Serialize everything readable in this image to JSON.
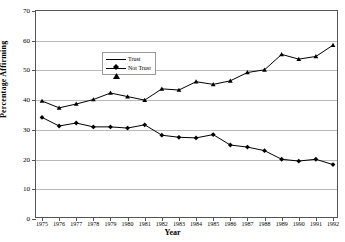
{
  "chart_data": {
    "type": "line",
    "title": "",
    "xlabel": "Year",
    "ylabel": "Percentage Affirming",
    "xlim": [
      1975,
      1992
    ],
    "ylim": [
      0,
      70
    ],
    "ytick_labels": [
      "0",
      "10",
      "20",
      "30",
      "40",
      "50",
      "60",
      "70"
    ],
    "yticks": [
      0,
      10,
      20,
      30,
      40,
      50,
      60,
      70
    ],
    "grid": "horizontal",
    "legend_position": "upper-left-inside",
    "x": [
      1975,
      1976,
      1977,
      1978,
      1979,
      1980,
      1981,
      1982,
      1983,
      1984,
      1985,
      1986,
      1987,
      1988,
      1989,
      1990,
      1991,
      1992
    ],
    "categories": [
      "1975",
      "1976",
      "1977",
      "1978",
      "1979",
      "1980",
      "1981",
      "1982",
      "1983",
      "1984",
      "1985",
      "1986",
      "1987",
      "1988",
      "1989",
      "1990",
      "1991",
      "1992"
    ],
    "series": [
      {
        "name": "Trust",
        "marker": "diamond",
        "color": "#000000",
        "values": [
          34.2,
          31.3,
          32.3,
          31.0,
          31.0,
          30.6,
          31.7,
          28.2,
          27.5,
          27.3,
          28.4,
          24.9,
          24.2,
          23.0,
          20.1,
          19.5,
          20.1,
          18.3
        ]
      },
      {
        "name": "Not Trust",
        "marker": "triangle",
        "color": "#000000",
        "values": [
          39.7,
          37.4,
          38.7,
          40.2,
          42.4,
          41.2,
          40.0,
          43.8,
          43.4,
          46.2,
          45.3,
          46.5,
          49.3,
          50.2,
          55.4,
          53.8,
          54.7,
          58.5
        ]
      }
    ]
  }
}
